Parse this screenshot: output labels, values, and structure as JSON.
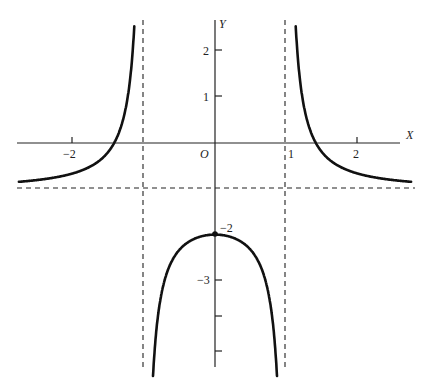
{
  "chart_data": {
    "type": "line",
    "title": "",
    "function": "y = (2 - x^2) / (x^2 - 1)",
    "xlabel": "X",
    "ylabel": "Y",
    "origin_label": "O",
    "xlim": [
      -2.75,
      2.75
    ],
    "ylim": [
      -5.2,
      2.7
    ],
    "x_ticks": [
      {
        "value": -2,
        "label": "-2"
      },
      {
        "value": 1,
        "label": "1"
      },
      {
        "value": 2,
        "label": "2"
      }
    ],
    "y_ticks": [
      {
        "value": 2,
        "label": "2"
      },
      {
        "value": 1,
        "label": "1"
      },
      {
        "value": -2,
        "label": "-2"
      },
      {
        "value": -3,
        "label": "-3"
      },
      {
        "value": -4,
        "label": ""
      },
      {
        "value": -5,
        "label": ""
      }
    ],
    "asymptotes": {
      "vertical": [
        -1,
        1
      ],
      "horizontal": [
        -1
      ]
    },
    "marked_points": [
      {
        "x": 0,
        "y": -2,
        "label": "-2"
      }
    ],
    "series": [
      {
        "name": "left branch",
        "x": [
          -2.75,
          -2.5,
          -2,
          -1.75,
          -1.5,
          -1.414,
          -1.3,
          -1.2,
          -1.1,
          -1.05
        ],
        "y": [
          -0.85,
          -0.81,
          -0.67,
          -0.52,
          -0.2,
          0,
          0.45,
          1.27,
          3.76,
          8.76
        ]
      },
      {
        "name": "middle branch",
        "x": [
          -0.95,
          -0.9,
          -0.8,
          -0.6,
          -0.4,
          -0.2,
          0,
          0.2,
          0.4,
          0.6,
          0.8,
          0.9,
          0.95
        ],
        "y": [
          -11.26,
          -6.26,
          -3.78,
          -2.56,
          -2.19,
          -2.04,
          -2,
          -2.04,
          -2.19,
          -2.56,
          -3.78,
          -6.26,
          -11.26
        ]
      },
      {
        "name": "right branch",
        "x": [
          1.05,
          1.1,
          1.2,
          1.3,
          1.414,
          1.5,
          1.75,
          2,
          2.5,
          2.75
        ],
        "y": [
          8.76,
          3.76,
          1.27,
          0.45,
          0,
          -0.2,
          -0.52,
          -0.67,
          -0.81,
          -0.85
        ]
      }
    ],
    "grid": false,
    "legend": null
  },
  "labels": {
    "x_axis": "X",
    "y_axis": "Y",
    "origin": "O",
    "tick_x_neg2": "−2",
    "tick_x_1": "1",
    "tick_x_2": "2",
    "tick_y_2": "2",
    "tick_y_1": "1",
    "tick_y_neg2": "−2",
    "tick_y_neg3": "−3"
  }
}
